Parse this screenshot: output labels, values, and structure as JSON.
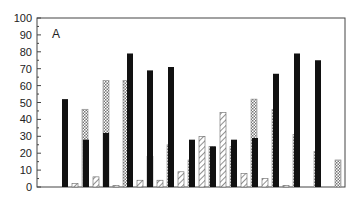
{
  "chart_data": {
    "type": "bar",
    "title": "",
    "panel_label": "A",
    "xlabel": "",
    "ylabel": "",
    "ylim": [
      0,
      100
    ],
    "yticks": [
      0,
      10,
      20,
      30,
      40,
      50,
      60,
      70,
      80,
      90,
      100
    ],
    "grid": false,
    "legend": null,
    "categories": [
      "1",
      "2",
      "3",
      "4",
      "5",
      "6",
      "7",
      "8",
      "9",
      "10",
      "11",
      "12",
      "13"
    ],
    "series": [
      {
        "name": "solid-black",
        "pattern": "solid",
        "color": "#111111",
        "values": [
          52,
          28,
          32,
          79,
          69,
          71,
          28,
          24,
          28,
          29,
          67,
          79,
          75
        ]
      },
      {
        "name": "diagonal-hatch",
        "pattern": "hatch",
        "color": "#555555",
        "values": [
          2,
          6,
          1,
          4,
          4,
          9,
          30,
          44,
          8,
          5,
          1,
          0,
          0
        ]
      },
      {
        "name": "checkered",
        "pattern": "check",
        "color": "#777777",
        "values": [
          46,
          63,
          63,
          18,
          25,
          16,
          24,
          24,
          52,
          46,
          31,
          21,
          16
        ]
      }
    ]
  },
  "layout": {
    "plot_left": 37,
    "plot_right": 345,
    "plot_top": 18,
    "plot_bottom": 187,
    "group_x": [
      62,
      83,
      103,
      127,
      147,
      168,
      189,
      210,
      231,
      252,
      273,
      294,
      315
    ],
    "bar_width": 6,
    "bar_gap": 1
  }
}
